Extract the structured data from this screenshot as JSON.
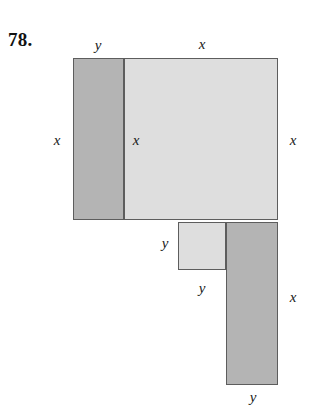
{
  "problem": {
    "number": "78."
  },
  "figure": {
    "colors": {
      "dark_fill": "#b4b4b4",
      "light_fill": "#dedede",
      "outline": "#5d5d5d",
      "text": "#1a1a1a",
      "background": "#ffffff"
    },
    "rectangles": [
      {
        "name": "left-tall-rectangle",
        "shade": "dark",
        "x": 73,
        "y": 58,
        "w": 51,
        "h": 162,
        "width_label": "y",
        "height_label": "x"
      },
      {
        "name": "large-square",
        "shade": "light",
        "x": 124,
        "y": 58,
        "w": 154,
        "h": 162,
        "width_label": "x",
        "height_label": "x"
      },
      {
        "name": "small-square",
        "shade": "light",
        "x": 178,
        "y": 222,
        "w": 48,
        "h": 48,
        "width_label": "y",
        "height_label": "y"
      },
      {
        "name": "bottom-right-tall-rectangle",
        "shade": "dark",
        "x": 226,
        "y": 222,
        "w": 52,
        "h": 163,
        "width_label": "y",
        "height_label": "x"
      }
    ],
    "labels": [
      {
        "name": "label-y-top-left",
        "text": "y",
        "x": 98,
        "y": 45
      },
      {
        "name": "label-x-top",
        "text": "x",
        "x": 202,
        "y": 44
      },
      {
        "name": "label-x-left-outer",
        "text": "x",
        "x": 57,
        "y": 140
      },
      {
        "name": "label-x-inner-divider",
        "text": "x",
        "x": 136,
        "y": 140
      },
      {
        "name": "label-x-right-outer",
        "text": "x",
        "x": 293,
        "y": 140
      },
      {
        "name": "label-y-small-square-left",
        "text": "y",
        "x": 165,
        "y": 243
      },
      {
        "name": "label-y-small-square-bottom",
        "text": "y",
        "x": 202,
        "y": 288
      },
      {
        "name": "label-x-bottom-right",
        "text": "x",
        "x": 293,
        "y": 297
      },
      {
        "name": "label-y-bottom",
        "text": "y",
        "x": 253,
        "y": 397
      }
    ]
  }
}
